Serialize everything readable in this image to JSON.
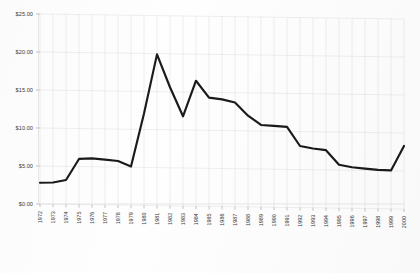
{
  "chart_data": {
    "type": "line",
    "title": "",
    "subtitle": "",
    "xlabel": "",
    "ylabel": "",
    "ylim": [
      0,
      25
    ],
    "ytick_values": [
      0,
      5,
      10,
      15,
      20,
      25
    ],
    "ytick_labels": [
      "$0.00",
      "$5.00",
      "$10.00",
      "$15.00",
      "$20.00",
      "$25.00"
    ],
    "grid": true,
    "legend": false,
    "legend_position": "none",
    "categories": [
      "1972",
      "1973",
      "1974",
      "1975",
      "1976",
      "1977",
      "1978",
      "1979",
      "1980",
      "1981",
      "1982",
      "1983",
      "1984",
      "1985",
      "1986",
      "1987",
      "1988",
      "1989",
      "1990",
      "1991",
      "1992",
      "1993",
      "1994",
      "1995",
      "1996",
      "1997",
      "1998",
      "1999",
      "2000"
    ],
    "series": [
      {
        "name": "Price",
        "color": "#1a1a1a",
        "values": [
          2.8,
          2.85,
          3.2,
          6.0,
          6.1,
          5.95,
          5.8,
          5.1,
          12.1,
          19.9,
          15.6,
          11.8,
          16.5,
          14.3,
          14.1,
          13.7,
          12.0,
          10.8,
          10.7,
          10.6,
          8.1,
          7.8,
          7.6,
          5.7,
          5.4,
          5.25,
          5.1,
          5.05,
          8.3
        ]
      }
    ]
  }
}
